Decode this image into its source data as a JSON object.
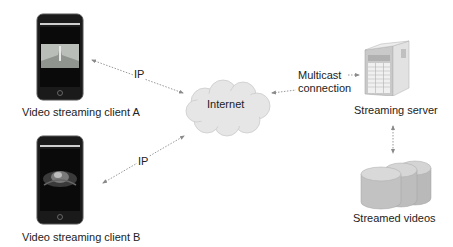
{
  "diagram": {
    "nodes": {
      "client_a": {
        "label": "Video streaming client A",
        "icon": "smartphone-icon",
        "screen": "landscape-video"
      },
      "client_b": {
        "label": "Video streaming client B",
        "icon": "smartphone-icon",
        "screen": "ultrasound-video"
      },
      "internet": {
        "label": "Internet",
        "icon": "cloud-icon"
      },
      "server": {
        "label": "Streaming server",
        "icon": "server-tower-icon"
      },
      "storage": {
        "label": "Streamed videos",
        "icon": "database-cylinders-icon"
      }
    },
    "edges": [
      {
        "from": "client_a",
        "to": "internet",
        "label": "IP",
        "style": "dotted",
        "arrows": "both"
      },
      {
        "from": "client_b",
        "to": "internet",
        "label": "IP",
        "style": "dotted",
        "arrows": "both"
      },
      {
        "from": "internet",
        "to": "server",
        "label_line1": "Multicast",
        "label_line2": "connection",
        "style": "dotted",
        "arrows": "both"
      },
      {
        "from": "server",
        "to": "storage",
        "label": "",
        "style": "dotted",
        "arrows": "both"
      }
    ],
    "colors": {
      "arrow": "#888888",
      "cloud": "#e4e4e4",
      "phone_body": "#1a1a1a",
      "server": "#cfcfcf",
      "cylinder": "#b8b8b8"
    }
  }
}
